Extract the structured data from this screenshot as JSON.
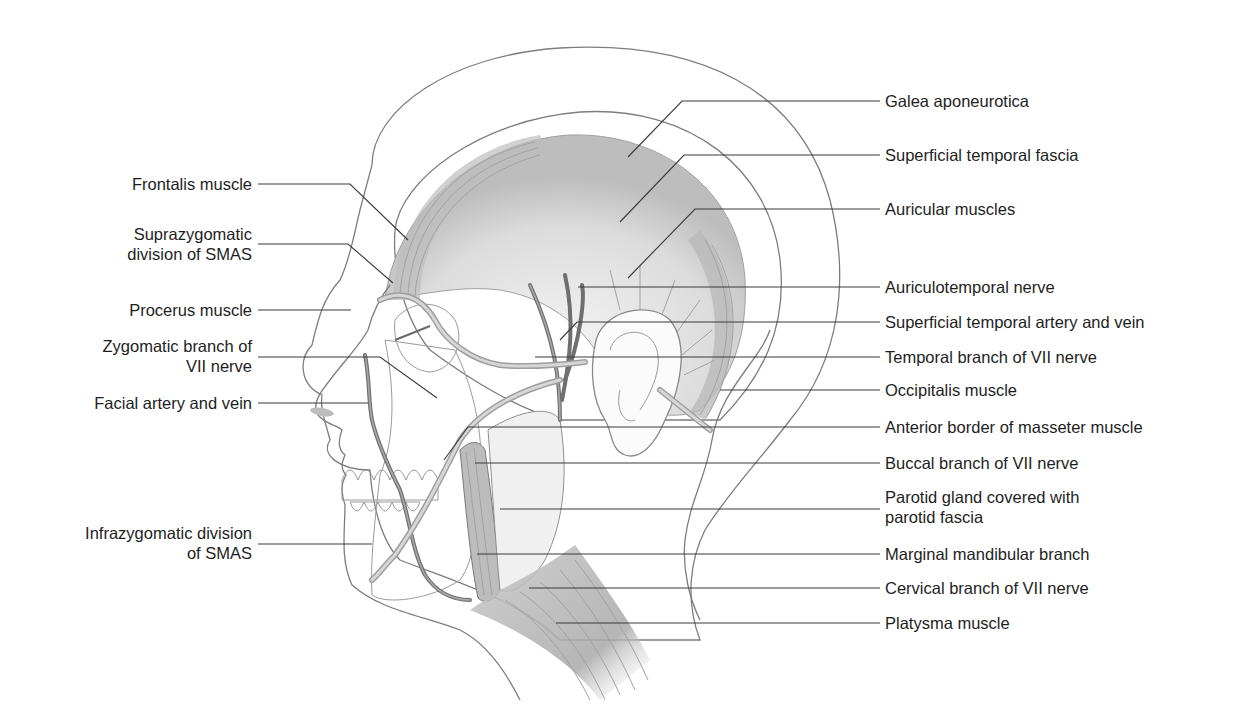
{
  "figure": {
    "colors": {
      "background": "#ffffff",
      "text": "#1e1e1e",
      "leader_line": "#3a3a3a",
      "outline": "#7d7d7d",
      "muscle_shade": "#b5b5b5",
      "fascia_shade": "#e6e6e6",
      "vessel": "#9e9e9e"
    }
  },
  "labels_left": [
    {
      "id": "frontalis",
      "lines": [
        "Frontalis muscle"
      ]
    },
    {
      "id": "suprazygomatic-smas",
      "lines": [
        "Suprazygomatic",
        "division of SMAS"
      ]
    },
    {
      "id": "procerus",
      "lines": [
        "Procerus muscle"
      ]
    },
    {
      "id": "zygomatic-branch",
      "lines": [
        "Zygomatic branch of",
        "VII nerve"
      ]
    },
    {
      "id": "facial-artery-vein",
      "lines": [
        "Facial artery and vein"
      ]
    },
    {
      "id": "infrazygomatic-smas",
      "lines": [
        "Infrazygomatic division",
        "of SMAS"
      ]
    }
  ],
  "labels_right": [
    {
      "id": "galea",
      "lines": [
        "Galea aponeurotica"
      ]
    },
    {
      "id": "superficial-temporal-fascia",
      "lines": [
        "Superficial temporal fascia"
      ]
    },
    {
      "id": "auricular-muscles",
      "lines": [
        "Auricular muscles"
      ]
    },
    {
      "id": "auriculotemporal-nerve",
      "lines": [
        "Auriculotemporal nerve"
      ]
    },
    {
      "id": "superficial-temporal-artery-vein",
      "lines": [
        "Superficial temporal artery and vein"
      ]
    },
    {
      "id": "temporal-branch",
      "lines": [
        "Temporal branch of VII nerve"
      ]
    },
    {
      "id": "occipitalis",
      "lines": [
        "Occipitalis muscle"
      ]
    },
    {
      "id": "masseter-border",
      "lines": [
        "Anterior border of masseter muscle"
      ]
    },
    {
      "id": "buccal-branch",
      "lines": [
        "Buccal branch of VII nerve"
      ]
    },
    {
      "id": "parotid-gland",
      "lines": [
        "Parotid gland covered with",
        "parotid fascia"
      ]
    },
    {
      "id": "marginal-mandibular",
      "lines": [
        "Marginal mandibular branch"
      ]
    },
    {
      "id": "cervical-branch",
      "lines": [
        "Cervical branch of VII nerve"
      ]
    },
    {
      "id": "platysma",
      "lines": [
        "Platysma muscle"
      ]
    }
  ]
}
